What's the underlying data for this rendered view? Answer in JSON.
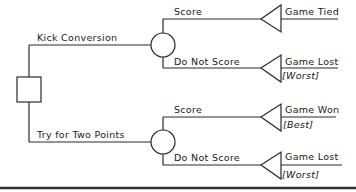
{
  "diagram": {
    "type": "decision-tree",
    "decision_node": {
      "shape": "square"
    },
    "branches": [
      {
        "label": "Kick Conversion",
        "chance_node": {
          "shape": "circle"
        },
        "outcomes": [
          {
            "event": "Score",
            "result": "Game Tied",
            "note": ""
          },
          {
            "event": "Do Not Score",
            "result": "Game Lost",
            "note": "[Worst]"
          }
        ]
      },
      {
        "label": "Try for Two Points",
        "chance_node": {
          "shape": "circle"
        },
        "outcomes": [
          {
            "event": "Score",
            "result": "Game Won",
            "note": "[Best]"
          },
          {
            "event": "Do Not Score",
            "result": "Game Lost",
            "note": "[Worst]"
          }
        ]
      }
    ],
    "colors": {
      "line": "#2a2a2a",
      "background": "#ffffff"
    }
  }
}
